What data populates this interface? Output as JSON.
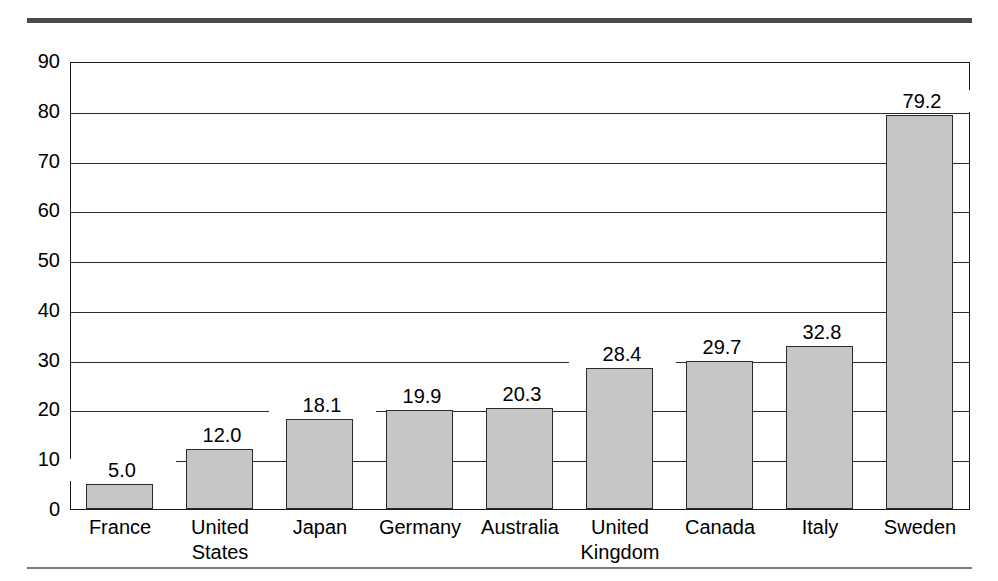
{
  "chart_data": {
    "type": "bar",
    "title": "",
    "subtitle": "",
    "xlabel": "",
    "ylabel": "",
    "ylim": [
      0,
      90
    ],
    "ytick_step": 10,
    "yticks": [
      "90",
      "80",
      "70",
      "60",
      "50",
      "40",
      "30",
      "20",
      "10",
      "0"
    ],
    "grid": true,
    "legend": "none",
    "orientation": "vertical",
    "categories": [
      "France",
      "United\nStates",
      "Japan",
      "Germany",
      "Australia",
      "United\nKingdom",
      "Canada",
      "Italy",
      "Sweden"
    ],
    "values": [
      5.0,
      12.0,
      18.1,
      19.9,
      20.3,
      28.4,
      29.7,
      32.8,
      79.2
    ],
    "value_labels": [
      "5.0",
      "12.0",
      "18.1",
      "19.9",
      "20.3",
      "28.4",
      "29.7",
      "32.8",
      "79.2"
    ],
    "bar_fill_color": "#c6c6c6",
    "bar_edge_color": "#2b2b2b",
    "axis_color": "#1a1a1a",
    "gridline_color": "#2b2b2b",
    "background_color": "#ffffff",
    "rule_top_color": "#4a4a4a",
    "rule_bottom_color": "#7a7a7a"
  }
}
